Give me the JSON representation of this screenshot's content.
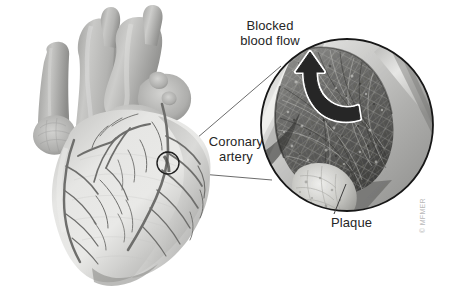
{
  "figure": {
    "background_color": "#ffffff",
    "width": 451,
    "height": 302
  },
  "labels": {
    "blocked_blood_flow": "Blocked\nblood flow",
    "blocked_blood_flow_line1": "Blocked",
    "blocked_blood_flow_line2": "blood flow",
    "coronary_artery": "Coronary\nartery",
    "coronary_artery_line1": "Coronary",
    "coronary_artery_line2": "artery",
    "plaque": "Plaque"
  },
  "credit": {
    "text": "© MFMER"
  },
  "colors": {
    "text": "#262626",
    "credit_text": "#b8b8b8",
    "leader_line": "#4a4a4a",
    "callout_outline": "#1a1a1a",
    "heart_light": "#e2e2e0",
    "heart_mid": "#b9b9b7",
    "heart_dark": "#8f8f8d",
    "vessel_line": "#6e6e6c",
    "artery_wall_light": "#d9d9d7",
    "artery_lumen_dark": "#3a3a3a",
    "plaque_fill": "#cfcfcb",
    "arrow_fill": "#2b2b2b",
    "arrow_outline": "#ffffff"
  },
  "anatomy": {
    "heart": {
      "name": "human heart anterior view",
      "features": [
        "aorta",
        "pulmonary trunk",
        "superior vena cava",
        "left ventricle",
        "right ventricle",
        "coronary arteries network"
      ]
    },
    "callout": {
      "name": "magnified cross-section of coronary artery",
      "center_x": 347,
      "center_y": 125,
      "radius": 87,
      "marker_circle": {
        "center_x": 168,
        "center_y": 163,
        "radius": 11
      },
      "contents": [
        "artery wall",
        "plaque buildup",
        "narrowed lumen",
        "blood flow arrow"
      ]
    }
  },
  "icons": {
    "blood_flow_arrow": "curved-up-arrow-icon",
    "marker": "circle-marker-icon"
  }
}
